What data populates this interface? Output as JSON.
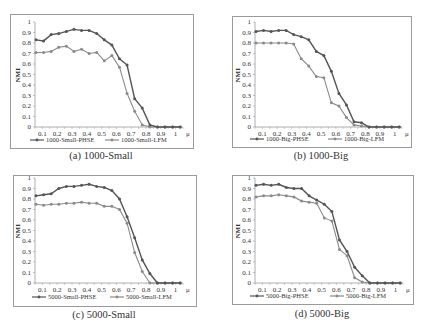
{
  "figure": {
    "captions": [
      "(a) 1000-Small",
      "(b) 1000-Big",
      "(c) 5000-Small",
      "(d) 5000-Big"
    ]
  },
  "chart_data": [
    {
      "id": "a",
      "type": "line",
      "title": "(a) 1000-Small",
      "xlabel": "μ",
      "ylabel": "NMI",
      "ylim": [
        0,
        1
      ],
      "yticks": [
        "0",
        "0.1",
        "0.2",
        "0.3",
        "0.4",
        "0.5",
        "0.6",
        "0.7",
        "0.8",
        "0.9",
        "1"
      ],
      "xticks": [
        "0.1",
        "0.2",
        "0.3",
        "0.4",
        "0.5",
        "0.6",
        "0.7",
        "0.8",
        "0.9",
        "1",
        "μ"
      ],
      "x": [
        0.05,
        0.1,
        0.15,
        0.2,
        0.25,
        0.3,
        0.35,
        0.4,
        0.45,
        0.5,
        0.55,
        0.6,
        0.65,
        0.7,
        0.75,
        0.8,
        0.85,
        0.9,
        0.95,
        1.0
      ],
      "grid": false,
      "legend_position": "bottom",
      "series": [
        {
          "name": "1000-Small-PHSE",
          "values": [
            0.83,
            0.82,
            0.88,
            0.89,
            0.91,
            0.93,
            0.92,
            0.92,
            0.89,
            0.83,
            0.78,
            0.65,
            0.59,
            0.27,
            0.18,
            0.02,
            0,
            0,
            0,
            0
          ]
        },
        {
          "name": "1000-Small-LFM",
          "values": [
            0.71,
            0.71,
            0.72,
            0.76,
            0.77,
            0.72,
            0.74,
            0.7,
            0.71,
            0.63,
            0.68,
            0.57,
            0.32,
            0.15,
            0.02,
            0,
            0,
            0,
            0,
            0
          ]
        }
      ]
    },
    {
      "id": "b",
      "type": "line",
      "title": "(b) 1000-Big",
      "xlabel": "μ",
      "ylabel": "NMI",
      "ylim": [
        0,
        1
      ],
      "yticks": [
        "0",
        "0.1",
        "0.2",
        "0.3",
        "0.4",
        "0.5",
        "0.6",
        "0.7",
        "0.8",
        "0.9",
        "1"
      ],
      "xticks": [
        "0.1",
        "0.2",
        "0.3",
        "0.4",
        "0.5",
        "0.6",
        "0.7",
        "0.8",
        "0.9",
        "1",
        "μ"
      ],
      "x": [
        0.05,
        0.1,
        0.15,
        0.2,
        0.25,
        0.3,
        0.35,
        0.4,
        0.45,
        0.5,
        0.55,
        0.6,
        0.65,
        0.7,
        0.75,
        0.8,
        0.85,
        0.9,
        0.95,
        1.0
      ],
      "grid": false,
      "legend_position": "bottom",
      "series": [
        {
          "name": "1000-Big-PHSE",
          "values": [
            0.91,
            0.92,
            0.91,
            0.92,
            0.92,
            0.88,
            0.86,
            0.83,
            0.72,
            0.68,
            0.53,
            0.32,
            0.21,
            0.05,
            0.04,
            0,
            0,
            0,
            0,
            0
          ]
        },
        {
          "name": "1000-Big-LFM",
          "values": [
            0.8,
            0.8,
            0.8,
            0.8,
            0.8,
            0.79,
            0.65,
            0.58,
            0.48,
            0.47,
            0.23,
            0.2,
            0.09,
            0.02,
            0.01,
            0,
            0,
            0,
            0,
            0
          ]
        }
      ]
    },
    {
      "id": "c",
      "type": "line",
      "title": "(c) 5000-Small",
      "xlabel": "μ",
      "ylabel": "NMI",
      "ylim": [
        0,
        1
      ],
      "yticks": [
        "0",
        "0.1",
        "0.2",
        "0.3",
        "0.4",
        "0.5",
        "0.6",
        "0.7",
        "0.8",
        "0.9",
        "1"
      ],
      "xticks": [
        "0.1",
        "0.2",
        "0.3",
        "0.4",
        "0.5",
        "0.6",
        "0.7",
        "0.8",
        "0.9",
        "1",
        "μ"
      ],
      "x": [
        0.05,
        0.1,
        0.15,
        0.2,
        0.25,
        0.3,
        0.35,
        0.4,
        0.45,
        0.5,
        0.55,
        0.6,
        0.65,
        0.7,
        0.75,
        0.8,
        0.85,
        0.9,
        0.95,
        1.0
      ],
      "grid": false,
      "legend_position": "bottom",
      "series": [
        {
          "name": "5000-Small-PHSE",
          "values": [
            0.83,
            0.84,
            0.85,
            0.9,
            0.92,
            0.92,
            0.93,
            0.94,
            0.92,
            0.91,
            0.88,
            0.8,
            0.63,
            0.43,
            0.22,
            0.09,
            0,
            0,
            0,
            0
          ]
        },
        {
          "name": "5000-Small-LFM",
          "values": [
            0.75,
            0.74,
            0.75,
            0.75,
            0.76,
            0.76,
            0.77,
            0.76,
            0.76,
            0.73,
            0.73,
            0.7,
            0.57,
            0.29,
            0.11,
            0,
            0,
            0,
            0,
            0
          ]
        }
      ]
    },
    {
      "id": "d",
      "type": "line",
      "title": "(d) 5000-Big",
      "xlabel": "μ",
      "ylabel": "NMI",
      "ylim": [
        0,
        1
      ],
      "yticks": [
        "0",
        "0.1",
        "0.2",
        "0.3",
        "0.4",
        "0.5",
        "0.6",
        "0.7",
        "0.8",
        "0.9",
        "1"
      ],
      "xticks": [
        "0.1",
        "0.2",
        "0.3",
        "0.4",
        "0.5",
        "0.6",
        "0.7",
        "0.8",
        "0.9",
        "1",
        "μ"
      ],
      "x": [
        0.05,
        0.1,
        0.15,
        0.2,
        0.25,
        0.3,
        0.35,
        0.4,
        0.45,
        0.5,
        0.55,
        0.6,
        0.65,
        0.7,
        0.75,
        0.8,
        0.85,
        0.9,
        0.95,
        1.0
      ],
      "grid": false,
      "legend_position": "bottom",
      "series": [
        {
          "name": "5000-Big-PHSE",
          "values": [
            0.93,
            0.94,
            0.93,
            0.94,
            0.91,
            0.9,
            0.9,
            0.83,
            0.79,
            0.75,
            0.68,
            0.41,
            0.3,
            0.15,
            0.07,
            0,
            0,
            0,
            0,
            0
          ]
        },
        {
          "name": "5000-Big-LFM",
          "values": [
            0.82,
            0.83,
            0.83,
            0.84,
            0.83,
            0.82,
            0.78,
            0.77,
            0.76,
            0.62,
            0.59,
            0.32,
            0.26,
            0.05,
            0.01,
            0,
            0,
            0,
            0,
            0
          ]
        }
      ]
    }
  ],
  "style": {
    "phse_color": "#555555",
    "lfm_color": "#8a8a8a",
    "axis_color": "#9a9a9a",
    "frame_color": "#9a9a9a"
  }
}
